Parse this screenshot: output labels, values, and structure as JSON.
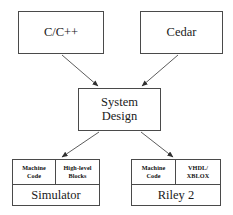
{
  "diagram": {
    "background_color": "#ffffff",
    "line_color": "#4a4a4a",
    "text_color": "#1a1a1a",
    "nodes": {
      "cpp": {
        "label": "C/C++"
      },
      "cedar": {
        "label": "Cedar"
      },
      "system_design": {
        "label": "System\nDesign"
      },
      "simulator": {
        "name": "Simulator",
        "cells": [
          {
            "label": "Machine\nCode"
          },
          {
            "label": "High-level\nBlocks"
          }
        ]
      },
      "riley": {
        "name": "Riley 2",
        "cells": [
          {
            "label": "Machine\nCode"
          },
          {
            "label": "VHDL/\nXBLOX"
          }
        ]
      }
    },
    "arrows": [
      {
        "name": "arrow-cpp-to-system-design",
        "from": "cpp",
        "to": "system_design"
      },
      {
        "name": "arrow-cedar-to-system-design",
        "from": "cedar",
        "to": "system_design"
      },
      {
        "name": "arrow-system-design-to-simulator",
        "from": "system_design",
        "to": "simulator"
      },
      {
        "name": "arrow-system-design-to-riley",
        "from": "system_design",
        "to": "riley"
      }
    ]
  }
}
